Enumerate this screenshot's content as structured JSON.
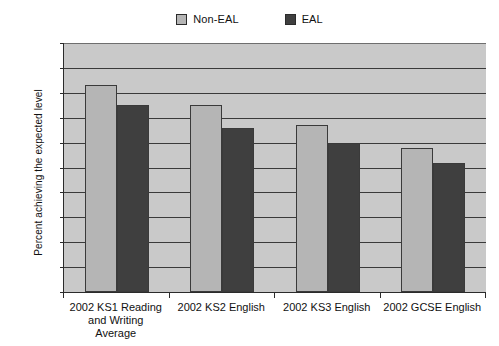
{
  "chart_data": {
    "type": "bar",
    "title": "",
    "subtitle": "",
    "xlabel": "",
    "ylabel": "Percent achieving the expected level",
    "ylim": [
      0,
      100
    ],
    "ytick_step": 10,
    "yticks": [
      0,
      10,
      20,
      30,
      40,
      50,
      60,
      70,
      80,
      90,
      100
    ],
    "grid": true,
    "legend_position": "top-center",
    "categories": [
      "2002 KS1 Reading and Writing Average",
      "2002 KS2 English",
      "2002 KS3 English",
      "2002 GCSE English"
    ],
    "category_label_lines": [
      [
        "2002 KS1 Reading",
        "and Writing",
        "Average"
      ],
      [
        "2002 KS2 English"
      ],
      [
        "2002 KS3 English"
      ],
      [
        "2002 GCSE English"
      ]
    ],
    "series": [
      {
        "name": "Non-EAL",
        "color": "#b5b5b5",
        "values": [
          83,
          75,
          67,
          58
        ]
      },
      {
        "name": "EAL",
        "color": "#3f3f3f",
        "values": [
          75,
          66,
          60,
          52
        ]
      }
    ]
  },
  "legend": {
    "entries": [
      {
        "label": "Non-EAL",
        "swatch": "legend-swatch-non-eal"
      },
      {
        "label": "EAL",
        "swatch": "legend-swatch-eal"
      }
    ]
  },
  "colors": {
    "plot_background": "#c9c9c9",
    "gridline": "#3a3a3a",
    "axis": "#2b2b2b",
    "series_non_eal": "#b5b5b5",
    "series_eal": "#3f3f3f",
    "page_background": "#ffffff",
    "text": "#111111"
  }
}
